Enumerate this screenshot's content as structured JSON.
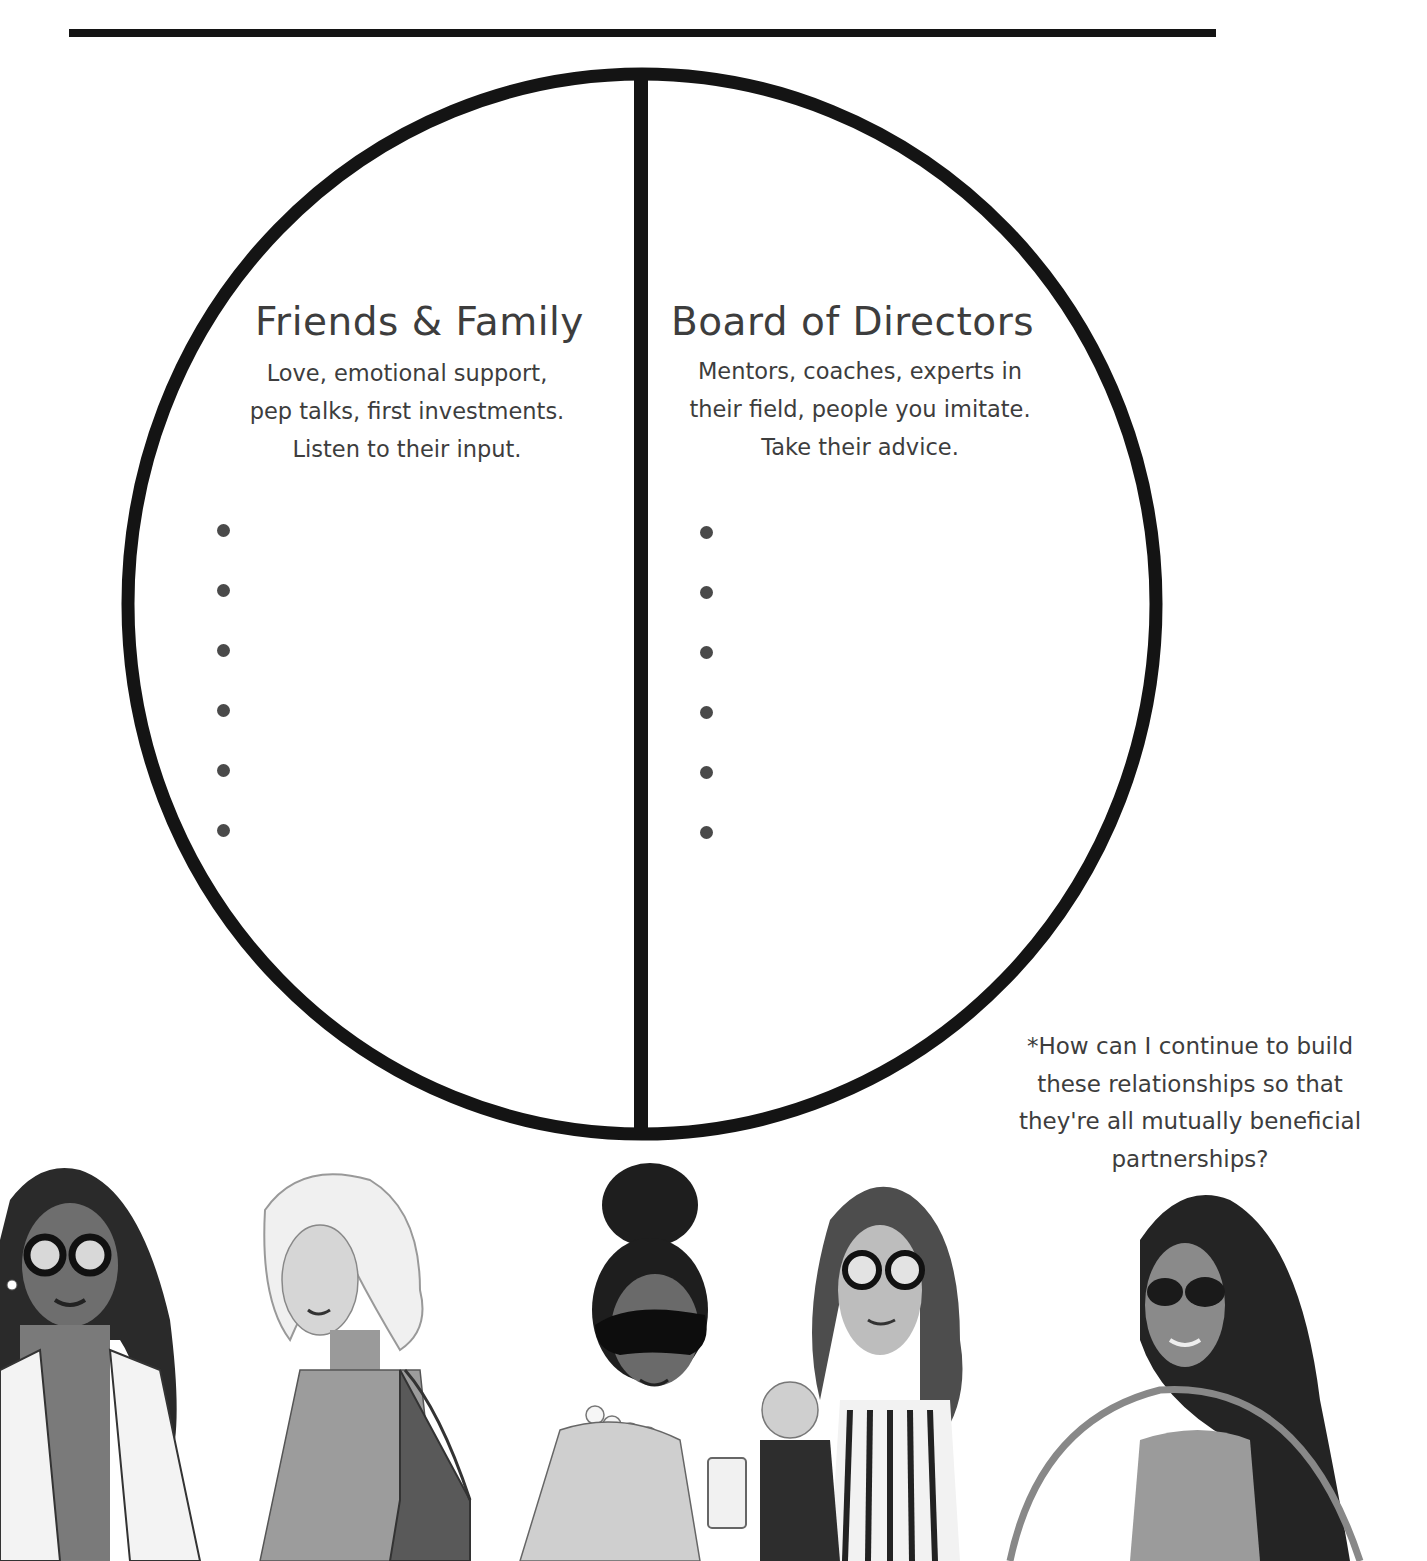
{
  "page": {
    "type": "worksheet",
    "colors": {
      "ink": "#141414",
      "text": "#3d3d3d",
      "bullet": "#4a4a4a",
      "background": "#ffffff"
    }
  },
  "diagram": {
    "shape": "circle-split-in-half",
    "sections": [
      {
        "id": "friends-family",
        "title": "Friends & Family",
        "description_lines": [
          "Love, emotional support,",
          "pep talks, first investments.",
          "Listen to their input."
        ],
        "bullet_count": 6,
        "entries": [
          "",
          "",
          "",
          "",
          "",
          ""
        ]
      },
      {
        "id": "board-of-directors",
        "title": "Board of Directors",
        "description_lines": [
          "Mentors, coaches, experts in",
          "their field, people you imitate.",
          "Take their advice."
        ],
        "bullet_count": 6,
        "entries": [
          "",
          "",
          "",
          "",
          "",
          ""
        ]
      }
    ]
  },
  "footnote": {
    "lines": [
      "*How can I continue to build",
      "these relationships so that",
      "they're all mutually beneficial",
      "partnerships?"
    ]
  },
  "illustration": {
    "description": "Grayscale fashion illustration of five women",
    "figures": [
      {
        "id": "woman-1",
        "features": "long dark hair, round glasses, white blazer, sequin top"
      },
      {
        "id": "woman-2",
        "features": "short platinum hair, turtleneck, shoulder tote bag"
      },
      {
        "id": "woman-3",
        "features": "high bun, cat-eye sunglasses, pearl necklace, draped blouse"
      },
      {
        "id": "woman-4",
        "features": "long wavy hair, glasses, striped sweater, holding child and coffee cup"
      },
      {
        "id": "woman-5",
        "features": "long dark hair, sunglasses, over-shoulder handbag"
      }
    ]
  }
}
